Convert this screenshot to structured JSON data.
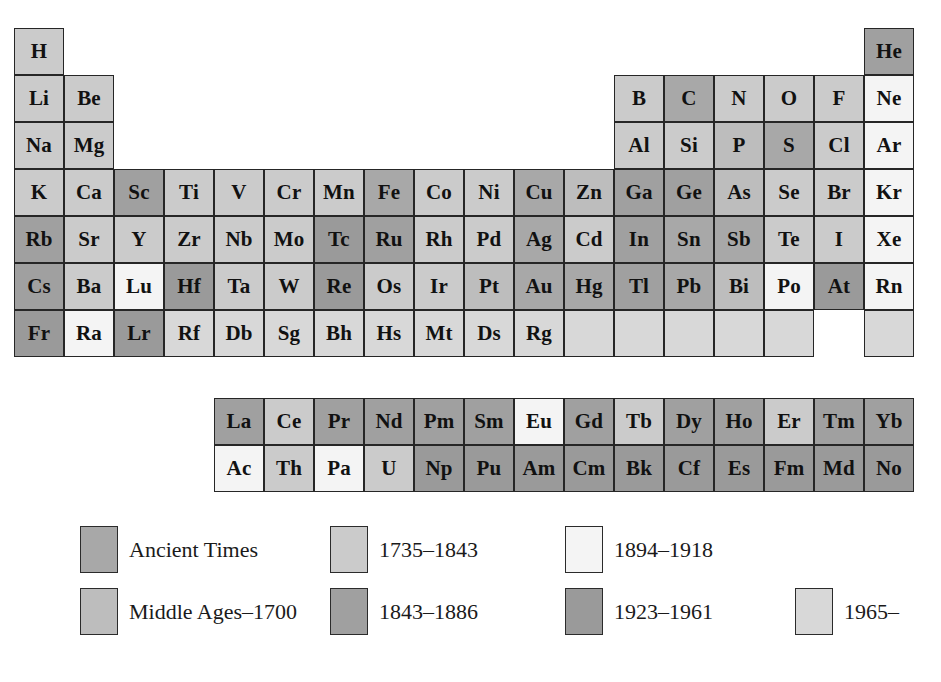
{
  "figure": {
    "kind": "periodic-table-of-elements"
  },
  "palette": {
    "ancient": "#a8a8a8",
    "middle_ages_1700": "#bdbdbd",
    "y1735_1843": "#cbcbcb",
    "y1843_1886": "#a0a0a0",
    "y1894_1918": "#f4f4f4",
    "y1923_1961": "#9a9a9a",
    "y1965_": "#d8d8d8",
    "border": "#262626",
    "text": "#111111",
    "background": "#ffffff"
  },
  "legend": {
    "items": [
      {
        "label": "Ancient Times",
        "color_key": "ancient",
        "color": "#a8a8a8",
        "col": 0,
        "row": 0
      },
      {
        "label": "1735–1843",
        "color_key": "y1735_1843",
        "color": "#cbcbcb",
        "col": 1,
        "row": 0
      },
      {
        "label": "1894–1918",
        "color_key": "y1894_1918",
        "color": "#f4f4f4",
        "col": 2,
        "row": 0
      },
      {
        "label": "Middle Ages–1700",
        "color_key": "middle_ages_1700",
        "color": "#bdbdbd",
        "col": 0,
        "row": 1
      },
      {
        "label": "1843–1886",
        "color_key": "y1843_1886",
        "color": "#a0a0a0",
        "col": 1,
        "row": 1
      },
      {
        "label": "1923–1961",
        "color_key": "y1923_1961",
        "color": "#9a9a9a",
        "col": 2,
        "row": 1
      },
      {
        "label": "1965–",
        "color_key": "y1965_",
        "color": "#d8d8d8",
        "col": 3,
        "row": 1
      }
    ]
  },
  "grid": {
    "cell_width": 50,
    "cell_height": 47,
    "origin_x": 14,
    "origin_y": 28,
    "main_rows": 7,
    "main_cols": 18,
    "fblock_origin_x": 214,
    "fblock_origin_y": 398,
    "fblock_cols": 14,
    "fblock_rows": 2
  },
  "chart_data": {
    "type": "heatmap",
    "legend_position": "below",
    "categories": [
      "Ancient Times",
      "Middle Ages–1700",
      "1735–1843",
      "1843–1886",
      "1894–1918",
      "1923–1961",
      "1965–"
    ],
    "main_block": [
      {
        "symbol": "H",
        "col": 1,
        "row": 1,
        "era": "y1735_1843"
      },
      {
        "symbol": "He",
        "col": 18,
        "row": 1,
        "era": "y1843_1886"
      },
      {
        "symbol": "Li",
        "col": 1,
        "row": 2,
        "era": "y1735_1843"
      },
      {
        "symbol": "Be",
        "col": 2,
        "row": 2,
        "era": "y1735_1843"
      },
      {
        "symbol": "B",
        "col": 13,
        "row": 2,
        "era": "y1735_1843"
      },
      {
        "symbol": "C",
        "col": 14,
        "row": 2,
        "era": "ancient"
      },
      {
        "symbol": "N",
        "col": 15,
        "row": 2,
        "era": "y1735_1843"
      },
      {
        "symbol": "O",
        "col": 16,
        "row": 2,
        "era": "y1735_1843"
      },
      {
        "symbol": "F",
        "col": 17,
        "row": 2,
        "era": "y1735_1843"
      },
      {
        "symbol": "Ne",
        "col": 18,
        "row": 2,
        "era": "y1894_1918"
      },
      {
        "symbol": "Na",
        "col": 1,
        "row": 3,
        "era": "y1735_1843"
      },
      {
        "symbol": "Mg",
        "col": 2,
        "row": 3,
        "era": "y1735_1843"
      },
      {
        "symbol": "Al",
        "col": 13,
        "row": 3,
        "era": "y1735_1843"
      },
      {
        "symbol": "Si",
        "col": 14,
        "row": 3,
        "era": "y1735_1843"
      },
      {
        "symbol": "P",
        "col": 15,
        "row": 3,
        "era": "middle_ages_1700"
      },
      {
        "symbol": "S",
        "col": 16,
        "row": 3,
        "era": "ancient"
      },
      {
        "symbol": "Cl",
        "col": 17,
        "row": 3,
        "era": "y1735_1843"
      },
      {
        "symbol": "Ar",
        "col": 18,
        "row": 3,
        "era": "y1894_1918"
      },
      {
        "symbol": "K",
        "col": 1,
        "row": 4,
        "era": "y1735_1843"
      },
      {
        "symbol": "Ca",
        "col": 2,
        "row": 4,
        "era": "y1735_1843"
      },
      {
        "symbol": "Sc",
        "col": 3,
        "row": 4,
        "era": "y1843_1886"
      },
      {
        "symbol": "Ti",
        "col": 4,
        "row": 4,
        "era": "y1735_1843"
      },
      {
        "symbol": "V",
        "col": 5,
        "row": 4,
        "era": "y1735_1843"
      },
      {
        "symbol": "Cr",
        "col": 6,
        "row": 4,
        "era": "y1735_1843"
      },
      {
        "symbol": "Mn",
        "col": 7,
        "row": 4,
        "era": "y1735_1843"
      },
      {
        "symbol": "Fe",
        "col": 8,
        "row": 4,
        "era": "ancient"
      },
      {
        "symbol": "Co",
        "col": 9,
        "row": 4,
        "era": "y1735_1843"
      },
      {
        "symbol": "Ni",
        "col": 10,
        "row": 4,
        "era": "y1735_1843"
      },
      {
        "symbol": "Cu",
        "col": 11,
        "row": 4,
        "era": "ancient"
      },
      {
        "symbol": "Zn",
        "col": 12,
        "row": 4,
        "era": "middle_ages_1700"
      },
      {
        "symbol": "Ga",
        "col": 13,
        "row": 4,
        "era": "y1843_1886"
      },
      {
        "symbol": "Ge",
        "col": 14,
        "row": 4,
        "era": "y1843_1886"
      },
      {
        "symbol": "As",
        "col": 15,
        "row": 4,
        "era": "middle_ages_1700"
      },
      {
        "symbol": "Se",
        "col": 16,
        "row": 4,
        "era": "y1735_1843"
      },
      {
        "symbol": "Br",
        "col": 17,
        "row": 4,
        "era": "y1735_1843"
      },
      {
        "symbol": "Kr",
        "col": 18,
        "row": 4,
        "era": "y1894_1918"
      },
      {
        "symbol": "Rb",
        "col": 1,
        "row": 5,
        "era": "y1843_1886"
      },
      {
        "symbol": "Sr",
        "col": 2,
        "row": 5,
        "era": "y1735_1843"
      },
      {
        "symbol": "Y",
        "col": 3,
        "row": 5,
        "era": "y1735_1843"
      },
      {
        "symbol": "Zr",
        "col": 4,
        "row": 5,
        "era": "y1735_1843"
      },
      {
        "symbol": "Nb",
        "col": 5,
        "row": 5,
        "era": "y1735_1843"
      },
      {
        "symbol": "Mo",
        "col": 6,
        "row": 5,
        "era": "y1735_1843"
      },
      {
        "symbol": "Tc",
        "col": 7,
        "row": 5,
        "era": "y1923_1961"
      },
      {
        "symbol": "Ru",
        "col": 8,
        "row": 5,
        "era": "y1843_1886"
      },
      {
        "symbol": "Rh",
        "col": 9,
        "row": 5,
        "era": "y1735_1843"
      },
      {
        "symbol": "Pd",
        "col": 10,
        "row": 5,
        "era": "y1735_1843"
      },
      {
        "symbol": "Ag",
        "col": 11,
        "row": 5,
        "era": "ancient"
      },
      {
        "symbol": "Cd",
        "col": 12,
        "row": 5,
        "era": "y1735_1843"
      },
      {
        "symbol": "In",
        "col": 13,
        "row": 5,
        "era": "y1843_1886"
      },
      {
        "symbol": "Sn",
        "col": 14,
        "row": 5,
        "era": "ancient"
      },
      {
        "symbol": "Sb",
        "col": 15,
        "row": 5,
        "era": "ancient"
      },
      {
        "symbol": "Te",
        "col": 16,
        "row": 5,
        "era": "y1735_1843"
      },
      {
        "symbol": "I",
        "col": 17,
        "row": 5,
        "era": "y1735_1843"
      },
      {
        "symbol": "Xe",
        "col": 18,
        "row": 5,
        "era": "y1894_1918"
      },
      {
        "symbol": "Cs",
        "col": 1,
        "row": 6,
        "era": "y1843_1886"
      },
      {
        "symbol": "Ba",
        "col": 2,
        "row": 6,
        "era": "y1735_1843"
      },
      {
        "symbol": "Lu",
        "col": 3,
        "row": 6,
        "era": "y1894_1918"
      },
      {
        "symbol": "Hf",
        "col": 4,
        "row": 6,
        "era": "y1923_1961"
      },
      {
        "symbol": "Ta",
        "col": 5,
        "row": 6,
        "era": "y1735_1843"
      },
      {
        "symbol": "W",
        "col": 6,
        "row": 6,
        "era": "y1735_1843"
      },
      {
        "symbol": "Re",
        "col": 7,
        "row": 6,
        "era": "y1923_1961"
      },
      {
        "symbol": "Os",
        "col": 8,
        "row": 6,
        "era": "y1735_1843"
      },
      {
        "symbol": "Ir",
        "col": 9,
        "row": 6,
        "era": "y1735_1843"
      },
      {
        "symbol": "Pt",
        "col": 10,
        "row": 6,
        "era": "middle_ages_1700"
      },
      {
        "symbol": "Au",
        "col": 11,
        "row": 6,
        "era": "ancient"
      },
      {
        "symbol": "Hg",
        "col": 12,
        "row": 6,
        "era": "ancient"
      },
      {
        "symbol": "Tl",
        "col": 13,
        "row": 6,
        "era": "y1843_1886"
      },
      {
        "symbol": "Pb",
        "col": 14,
        "row": 6,
        "era": "ancient"
      },
      {
        "symbol": "Bi",
        "col": 15,
        "row": 6,
        "era": "middle_ages_1700"
      },
      {
        "symbol": "Po",
        "col": 16,
        "row": 6,
        "era": "y1894_1918"
      },
      {
        "symbol": "At",
        "col": 17,
        "row": 6,
        "era": "y1923_1961"
      },
      {
        "symbol": "Rn",
        "col": 18,
        "row": 6,
        "era": "y1894_1918"
      },
      {
        "symbol": "Fr",
        "col": 1,
        "row": 7,
        "era": "y1923_1961"
      },
      {
        "symbol": "Ra",
        "col": 2,
        "row": 7,
        "era": "y1894_1918"
      },
      {
        "symbol": "Lr",
        "col": 3,
        "row": 7,
        "era": "y1923_1961"
      },
      {
        "symbol": "Rf",
        "col": 4,
        "row": 7,
        "era": "y1965_"
      },
      {
        "symbol": "Db",
        "col": 5,
        "row": 7,
        "era": "y1965_"
      },
      {
        "symbol": "Sg",
        "col": 6,
        "row": 7,
        "era": "y1965_"
      },
      {
        "symbol": "Bh",
        "col": 7,
        "row": 7,
        "era": "y1965_"
      },
      {
        "symbol": "Hs",
        "col": 8,
        "row": 7,
        "era": "y1965_"
      },
      {
        "symbol": "Mt",
        "col": 9,
        "row": 7,
        "era": "y1965_"
      },
      {
        "symbol": "Ds",
        "col": 10,
        "row": 7,
        "era": "y1965_"
      },
      {
        "symbol": "Rg",
        "col": 11,
        "row": 7,
        "era": "y1965_"
      },
      {
        "symbol": "",
        "col": 12,
        "row": 7,
        "era": "y1965_"
      },
      {
        "symbol": "",
        "col": 13,
        "row": 7,
        "era": "y1965_"
      },
      {
        "symbol": "",
        "col": 14,
        "row": 7,
        "era": "y1965_"
      },
      {
        "symbol": "",
        "col": 15,
        "row": 7,
        "era": "y1965_"
      },
      {
        "symbol": "",
        "col": 16,
        "row": 7,
        "era": "y1965_"
      },
      {
        "symbol": "",
        "col": 18,
        "row": 7,
        "era": "y1965_"
      }
    ],
    "lanthanides": [
      {
        "symbol": "La",
        "col": 1,
        "era": "y1843_1886"
      },
      {
        "symbol": "Ce",
        "col": 2,
        "era": "y1735_1843"
      },
      {
        "symbol": "Pr",
        "col": 3,
        "era": "y1843_1886"
      },
      {
        "symbol": "Nd",
        "col": 4,
        "era": "y1843_1886"
      },
      {
        "symbol": "Pm",
        "col": 5,
        "era": "y1843_1886"
      },
      {
        "symbol": "Sm",
        "col": 6,
        "era": "y1843_1886"
      },
      {
        "symbol": "Eu",
        "col": 7,
        "era": "y1894_1918"
      },
      {
        "symbol": "Gd",
        "col": 8,
        "era": "y1843_1886"
      },
      {
        "symbol": "Tb",
        "col": 9,
        "era": "y1735_1843"
      },
      {
        "symbol": "Dy",
        "col": 10,
        "era": "y1843_1886"
      },
      {
        "symbol": "Ho",
        "col": 11,
        "era": "y1843_1886"
      },
      {
        "symbol": "Er",
        "col": 12,
        "era": "y1735_1843"
      },
      {
        "symbol": "Tm",
        "col": 13,
        "era": "y1843_1886"
      },
      {
        "symbol": "Yb",
        "col": 14,
        "era": "y1843_1886"
      }
    ],
    "actinides": [
      {
        "symbol": "Ac",
        "col": 1,
        "era": "y1894_1918"
      },
      {
        "symbol": "Th",
        "col": 2,
        "era": "y1735_1843"
      },
      {
        "symbol": "Pa",
        "col": 3,
        "era": "y1894_1918"
      },
      {
        "symbol": "U",
        "col": 4,
        "era": "y1735_1843"
      },
      {
        "symbol": "Np",
        "col": 5,
        "era": "y1923_1961"
      },
      {
        "symbol": "Pu",
        "col": 6,
        "era": "y1923_1961"
      },
      {
        "symbol": "Am",
        "col": 7,
        "era": "y1923_1961"
      },
      {
        "symbol": "Cm",
        "col": 8,
        "era": "y1923_1961"
      },
      {
        "symbol": "Bk",
        "col": 9,
        "era": "y1923_1961"
      },
      {
        "symbol": "Cf",
        "col": 10,
        "era": "y1923_1961"
      },
      {
        "symbol": "Es",
        "col": 11,
        "era": "y1923_1961"
      },
      {
        "symbol": "Fm",
        "col": 12,
        "era": "y1923_1961"
      },
      {
        "symbol": "Md",
        "col": 13,
        "era": "y1923_1961"
      },
      {
        "symbol": "No",
        "col": 14,
        "era": "y1923_1961"
      }
    ]
  }
}
